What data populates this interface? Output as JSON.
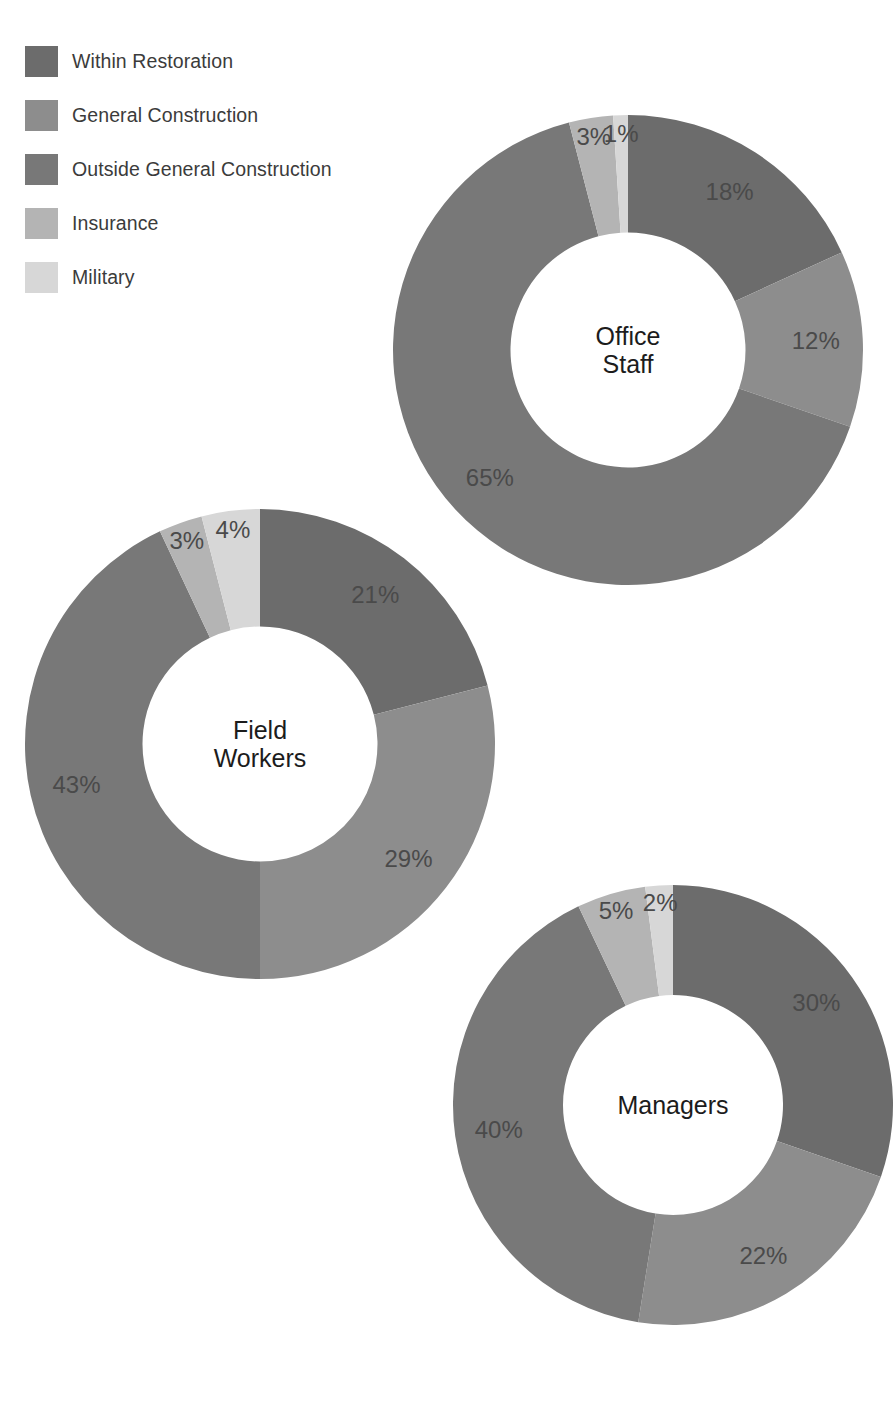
{
  "legend": {
    "items": [
      {
        "label": "Within Restoration",
        "color": "#6c6c6c"
      },
      {
        "label": "General Construction",
        "color": "#8d8d8d"
      },
      {
        "label": "Outside General Construction",
        "color": "#787878"
      },
      {
        "label": "Insurance",
        "color": "#b4b4b4"
      },
      {
        "label": "Military",
        "color": "#d7d7d7"
      }
    ]
  },
  "chart_data": [
    {
      "type": "pie",
      "title": "Office Staff",
      "center_label": "Office\nStaff",
      "categories": [
        "Within Restoration",
        "General Construction",
        "Outside General Construction",
        "Insurance",
        "Military"
      ],
      "values": [
        18,
        12,
        65,
        3,
        1
      ],
      "labels": [
        "18%",
        "12%",
        "65%",
        "3%",
        "1%"
      ],
      "colors": [
        "#6c6c6c",
        "#8d8d8d",
        "#787878",
        "#b4b4b4",
        "#d7d7d7"
      ],
      "hole_ratio": 0.5,
      "start_angle": 0,
      "direction": "clockwise",
      "legend_position": "top-left",
      "grid": false
    },
    {
      "type": "pie",
      "title": "Field Workers",
      "center_label": "Field\nWorkers",
      "categories": [
        "Within Restoration",
        "General Construction",
        "Outside General Construction",
        "Insurance",
        "Military"
      ],
      "values": [
        21,
        29,
        43,
        3,
        4
      ],
      "labels": [
        "21%",
        "29%",
        "43%",
        "3%",
        "4%"
      ],
      "colors": [
        "#6c6c6c",
        "#8d8d8d",
        "#787878",
        "#b4b4b4",
        "#d7d7d7"
      ],
      "hole_ratio": 0.5,
      "start_angle": 0,
      "direction": "clockwise",
      "legend_position": "top-left",
      "grid": false
    },
    {
      "type": "pie",
      "title": "Managers",
      "center_label": "Managers",
      "categories": [
        "Within Restoration",
        "General Construction",
        "Outside General Construction",
        "Insurance",
        "Military"
      ],
      "values": [
        30,
        22,
        40,
        5,
        2
      ],
      "labels": [
        "30%",
        "22%",
        "40%",
        "5%",
        "2%"
      ],
      "colors": [
        "#6c6c6c",
        "#8d8d8d",
        "#787878",
        "#b4b4b4",
        "#d7d7d7"
      ],
      "hole_ratio": 0.5,
      "start_angle": 0,
      "direction": "clockwise",
      "legend_position": "top-left",
      "grid": false
    }
  ],
  "charts_layout": [
    {
      "left": 393,
      "top": 115,
      "size": 470,
      "label_radius_factor": 0.8,
      "center_font": 25
    },
    {
      "left": 25,
      "top": 509,
      "size": 470,
      "label_radius_factor": 0.8,
      "center_font": 25
    },
    {
      "left": 453,
      "top": 885,
      "size": 440,
      "label_radius_factor": 0.8,
      "center_font": 25
    }
  ]
}
